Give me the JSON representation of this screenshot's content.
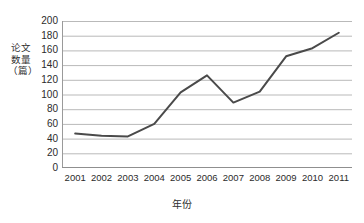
{
  "chart_data": {
    "type": "line",
    "title": "",
    "subtitle": "",
    "xlabel": "年份",
    "ylabel": "论文数量\n（篇）",
    "ylabel_chars": "论文数量（篇）",
    "categories": [
      "2001",
      "2002",
      "2003",
      "2004",
      "2005",
      "2006",
      "2007",
      "2008",
      "2009",
      "2010",
      "2011"
    ],
    "x": [
      2001,
      2002,
      2003,
      2004,
      2005,
      2006,
      2007,
      2008,
      2009,
      2010,
      2011
    ],
    "values": [
      47,
      44,
      43,
      60,
      103,
      126,
      89,
      104,
      152,
      163,
      184
    ],
    "series": [
      {
        "name": "论文数量",
        "values": [
          47,
          44,
          43,
          60,
          103,
          126,
          89,
          104,
          152,
          163,
          184
        ]
      }
    ],
    "ylim": [
      0,
      200
    ],
    "y_ticks": [
      0,
      20,
      40,
      60,
      80,
      100,
      120,
      140,
      160,
      180,
      200
    ],
    "y_tick_labels": [
      "0",
      "20",
      "40",
      "60",
      "80",
      "100",
      "120",
      "140",
      "160",
      "180",
      "200"
    ],
    "grid": "horizontal",
    "legend": "none",
    "line_color": "#4a4a4a",
    "grid_color": "#b9b9b9",
    "axis_color": "#8f8f8f",
    "background_color": "#ffffff",
    "annotations": []
  }
}
